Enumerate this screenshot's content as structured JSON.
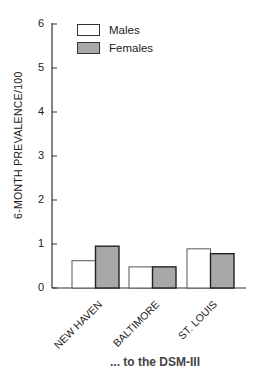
{
  "chart_data": {
    "type": "bar",
    "title": "",
    "xlabel": "",
    "ylabel": "6-MONTH PREVALENCE/100",
    "ylim": [
      0,
      6
    ],
    "yticks": [
      0,
      1,
      2,
      3,
      4,
      5,
      6
    ],
    "grid": false,
    "legend_position": "upper right",
    "categories": [
      "NEW HAVEN",
      "BALTIMORE",
      "ST. LOUIS"
    ],
    "series": [
      {
        "name": "Males",
        "color": "#ffffff",
        "values": [
          0.62,
          0.48,
          0.89
        ]
      },
      {
        "name": "Females",
        "color": "#a8a8a8",
        "values": [
          0.95,
          0.48,
          0.78
        ]
      }
    ]
  },
  "legend": {
    "males": "Males",
    "females": "Females"
  },
  "axis": {
    "ylabel": "6-MONTH PREVALENCE/100",
    "ticks": [
      "0",
      "1",
      "2",
      "3",
      "4",
      "5",
      "6"
    ]
  },
  "xlabels": [
    "NEW HAVEN",
    "BALTIMORE",
    "ST. LOUIS"
  ],
  "caption_fragment": "... to the DSM-III"
}
